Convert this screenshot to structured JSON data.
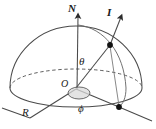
{
  "figure": {
    "type": "geometry-diagram",
    "width": 156,
    "height": 129,
    "background_color": "#ffffff",
    "stroke_color": "#3a3a3a",
    "label_color": "#1a1a1a"
  },
  "labels": {
    "north_axis": "N",
    "intensity_vector": "I",
    "polar_angle": "θ",
    "origin": "O",
    "azimuth_angle": "ϕ",
    "reference_axis": "R"
  },
  "elements": {
    "dome_outline": "hemisphere-dome",
    "equator_front": "solid-front-equator-arc",
    "equator_back": "dashed-back-equator-arc",
    "meridian_arc": "great-circle-through-point",
    "vector_arrow": "I-direction-arrow",
    "axis_arrow": "N-zenith-arrow",
    "surface_point": "point-on-sphere",
    "base_point": "point-on-equator",
    "azimuth_ellipse": "shaded-azimuth-indicator"
  },
  "geometry": {
    "origin": {
      "x": 76,
      "y": 88
    },
    "dome_radius_x": 66,
    "dome_radius_y": 62,
    "base_ellipse_ry": 18,
    "surface_point": {
      "x": 110,
      "y": 45
    },
    "base_point": {
      "x": 119,
      "y": 107
    },
    "n_axis_top": {
      "x": 78,
      "y": 12
    },
    "i_arrow_tip": {
      "x": 122,
      "y": 13
    }
  }
}
